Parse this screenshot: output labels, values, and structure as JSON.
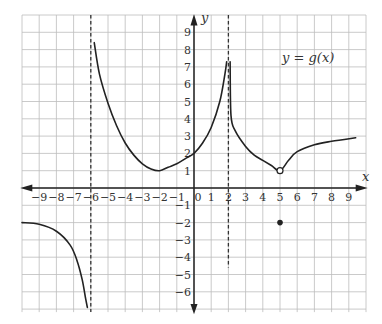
{
  "chart_data": {
    "type": "line",
    "title": "",
    "function_label": "y = g(x)",
    "xlabel": "x",
    "ylabel": "y",
    "xlim": [
      -10,
      10
    ],
    "ylim": [
      -7,
      10
    ],
    "grid": true,
    "x_ticks": [
      "-9",
      "-8",
      "-7",
      "-6",
      "-5",
      "-4",
      "-3",
      "-2",
      "-1",
      "0",
      "1",
      "2",
      "3",
      "4",
      "5",
      "6",
      "7",
      "8",
      "9"
    ],
    "y_ticks": [
      "9",
      "8",
      "7",
      "6",
      "5",
      "4",
      "3",
      "2",
      "1",
      "-1",
      "-2",
      "-3",
      "-4",
      "-5",
      "-6"
    ],
    "vertical_asymptotes": [
      -6,
      2
    ],
    "series": [
      {
        "name": "branch-left",
        "points": [
          [
            -10,
            -2
          ],
          [
            -9,
            -2.1
          ],
          [
            -8,
            -2.5
          ],
          [
            -7.2,
            -3.3
          ],
          [
            -6.8,
            -4.2
          ],
          [
            -6.5,
            -5.3
          ],
          [
            -6.3,
            -6.4
          ],
          [
            -6.2,
            -6.9
          ]
        ]
      },
      {
        "name": "branch-middle",
        "points": [
          [
            -5.8,
            8.4
          ],
          [
            -5.5,
            6.6
          ],
          [
            -5,
            4.9
          ],
          [
            -4.5,
            3.6
          ],
          [
            -4,
            2.6
          ],
          [
            -3.5,
            1.9
          ],
          [
            -3,
            1.4
          ],
          [
            -2.5,
            1.1
          ],
          [
            -2,
            1
          ],
          [
            -1.5,
            1.2
          ],
          [
            -1,
            1.4
          ],
          [
            -0.5,
            1.7
          ],
          [
            0,
            2
          ],
          [
            0.5,
            2.6
          ],
          [
            1,
            3.5
          ],
          [
            1.5,
            5
          ],
          [
            1.8,
            6.6
          ],
          [
            1.9,
            7.3
          ]
        ]
      },
      {
        "name": "branch-right",
        "points": [
          [
            2.1,
            7.3
          ],
          [
            2.15,
            4.2
          ],
          [
            2.4,
            3.3
          ],
          [
            3,
            2.4
          ],
          [
            3.5,
            1.9
          ],
          [
            4,
            1.6
          ],
          [
            4.5,
            1.3
          ],
          [
            5,
            1
          ],
          [
            5.5,
            1.6
          ],
          [
            6,
            2.1
          ],
          [
            7,
            2.5
          ],
          [
            8,
            2.7
          ],
          [
            9.4,
            2.9
          ]
        ]
      }
    ],
    "open_points": [
      [
        5,
        1
      ]
    ],
    "closed_points": [
      [
        5,
        -2
      ]
    ]
  },
  "labels": {
    "x_axis": "x",
    "y_axis": "y",
    "function": "y = g(x)"
  }
}
